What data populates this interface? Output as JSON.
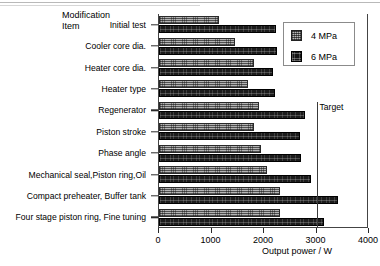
{
  "chart_data": {
    "type": "bar",
    "orientation": "horizontal",
    "title": "",
    "xlabel": "Output power / W",
    "ylabel": "Modification Item",
    "ylabel_lines": [
      "Modification",
      "Item"
    ],
    "xlim": [
      0,
      4000
    ],
    "xticks": [
      0,
      1000,
      2000,
      3000,
      4000
    ],
    "xticklabels": [
      "0",
      "1000",
      "2000",
      "3000",
      "4000"
    ],
    "grid": false,
    "legend_position": "upper right",
    "categories": [
      "Initial test",
      "Cooler core dia.",
      "Heater core dia.",
      "Heater type",
      "Regenerator",
      "Piston stroke",
      "Phase angle",
      "Mechanical seal,Piston ring,Oil",
      "Compact preheater, Buffer tank",
      "Four stage piston ring, Fine tuning"
    ],
    "series": [
      {
        "name": "4 MPa",
        "values": [
          1150,
          1450,
          1800,
          1700,
          1900,
          1800,
          1950,
          2050,
          2300,
          2300
        ]
      },
      {
        "name": "6 MPa",
        "values": [
          2230,
          2250,
          2180,
          2200,
          2780,
          2680,
          2700,
          2900,
          3400,
          3150
        ]
      }
    ],
    "annotations": [
      {
        "label": "Target",
        "x_value": 3000,
        "type": "vertical-line"
      }
    ]
  },
  "legend": {
    "entries": [
      {
        "label": "4 MPa",
        "swatch": "hatched-light"
      },
      {
        "label": "6 MPa",
        "swatch": "hatched-dark"
      }
    ]
  }
}
